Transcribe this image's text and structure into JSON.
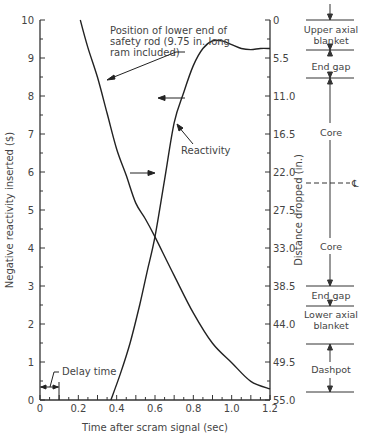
{
  "chart_data": {
    "type": "line",
    "title": "",
    "xlabel": "Time after scram signal (sec)",
    "ylabel": "Negative reactivity inserted ($)",
    "y2label": "Distance dropped (in.)",
    "xlim": [
      0,
      1.2
    ],
    "ylim": [
      0,
      10
    ],
    "y2lim": [
      0,
      55.0
    ],
    "grid": false,
    "x_ticks": [
      "0",
      "0.2",
      "0.4",
      "0.6",
      "0.8",
      "1.0",
      "1.2"
    ],
    "y_ticks": [
      "0",
      "1",
      "2",
      "3",
      "4",
      "5",
      "6",
      "7",
      "8",
      "9",
      "10"
    ],
    "y2_ticks": [
      "0",
      "5.5",
      "11.0",
      "16.5",
      "22.0",
      "27.5",
      "33.0",
      "38.5",
      "44.0",
      "49.5",
      "55.0"
    ],
    "series": [
      {
        "name": "Reactivity",
        "axis": "left",
        "x": [
          0.37,
          0.42,
          0.47,
          0.52,
          0.56,
          0.6,
          0.65,
          0.7,
          0.75,
          0.8,
          0.85,
          0.9,
          0.95,
          1.0,
          1.05,
          1.1,
          1.15,
          1.2
        ],
        "y": [
          0.0,
          0.7,
          1.5,
          2.5,
          3.4,
          4.3,
          5.8,
          7.3,
          8.1,
          8.8,
          9.25,
          9.45,
          9.45,
          9.35,
          9.25,
          9.22,
          9.25,
          9.25
        ]
      },
      {
        "name": "Position of lower end of safety rod (9.75 in. long ram included)",
        "axis": "right",
        "x": [
          0.21,
          0.25,
          0.3,
          0.35,
          0.4,
          0.45,
          0.5,
          0.55,
          0.6,
          0.7,
          0.8,
          0.9,
          1.0,
          1.1,
          1.2
        ],
        "y": [
          0.0,
          4.0,
          8.3,
          13.5,
          18.7,
          22.5,
          26.5,
          28.8,
          31.4,
          37.0,
          42.4,
          46.8,
          49.6,
          52.3,
          53.4
        ]
      }
    ],
    "annotations": [
      {
        "text": "Position of lower end of safety rod (9.75 in. long ram included)",
        "points_to": "rod position curve"
      },
      {
        "text": "Reactivity",
        "points_to": "reactivity curve"
      },
      {
        "text": "Delay time",
        "span": [
          0,
          0.1
        ]
      }
    ],
    "side_diagram": {
      "regions": [
        "Upper axial blanket",
        "End gap",
        "Core",
        "Core",
        "End gap",
        "Lower axial blanket",
        "Dashpot"
      ],
      "centerline_label": "℄"
    }
  },
  "labels": {
    "annot_rod_1": "Position of lower end of",
    "annot_rod_2": "safety rod (9.75 in. long",
    "annot_rod_3": "ram included)",
    "annot_react": "Reactivity",
    "annot_delay": "Delay time",
    "region_upper_1": "Upper axial",
    "region_upper_2": "blanket",
    "region_endgap_top": "End gap",
    "region_core_top": "Core",
    "region_core_bottom": "Core",
    "region_endgap_bottom": "End gap",
    "region_lower_1": "Lower axial",
    "region_lower_2": "blanket",
    "region_dashpot": "Dashpot",
    "centerline": "℄"
  }
}
